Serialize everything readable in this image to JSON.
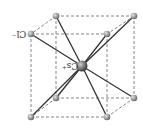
{
  "diagram": {
    "labels": {
      "anion": "Cl⁻",
      "cation": "Cs⁺"
    },
    "colors": {
      "edge": "#555555",
      "bond": "#333333",
      "atom": "#888888",
      "center_atom": "#666666"
    },
    "corners": [
      {
        "id": "back-top-left",
        "x": 56,
        "y": 16
      },
      {
        "id": "back-top-right",
        "x": 134,
        "y": 16
      },
      {
        "id": "front-top-left",
        "x": 31,
        "y": 34
      },
      {
        "id": "front-top-right",
        "x": 107,
        "y": 34
      },
      {
        "id": "back-bottom-left",
        "x": 56,
        "y": 98
      },
      {
        "id": "back-bottom-right",
        "x": 134,
        "y": 98
      },
      {
        "id": "front-bottom-left",
        "x": 31,
        "y": 117
      },
      {
        "id": "front-bottom-right",
        "x": 107,
        "y": 117
      }
    ],
    "center": {
      "x": 82,
      "y": 66
    }
  }
}
